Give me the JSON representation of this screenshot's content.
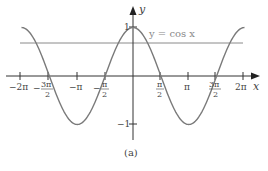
{
  "chart_data": {
    "type": "line",
    "title": "",
    "caption": "(a)",
    "xlabel": "x",
    "ylabel": "y",
    "series": [
      {
        "name": "y = cos x",
        "function": "cos(x)",
        "x_range": [
          "-2π",
          "2π"
        ]
      },
      {
        "name": "horizontal line",
        "function": "constant",
        "approx_value": 0.66
      }
    ],
    "annotation": "y = cos x",
    "xlim": [
      "-2π",
      "2π"
    ],
    "ylim": [
      -1,
      1
    ],
    "x_ticks": [
      {
        "label": "−2π",
        "value": -6.2832
      },
      {
        "label": "3π/2",
        "num": "3π",
        "den": "2",
        "neg": true,
        "value": -4.7124
      },
      {
        "label": "−π",
        "value": -3.1416
      },
      {
        "label": "π/2",
        "num": "π",
        "den": "2",
        "neg": true,
        "value": -1.5708
      },
      {
        "label": "π/2",
        "num": "π",
        "den": "2",
        "neg": false,
        "value": 1.5708
      },
      {
        "label": "π",
        "value": 3.1416
      },
      {
        "label": "3π/2",
        "num": "3π",
        "den": "2",
        "neg": false,
        "value": 4.7124
      },
      {
        "label": "2π",
        "value": 6.2832
      }
    ],
    "y_ticks": [
      {
        "label": "1",
        "value": 1
      },
      {
        "label": "−1",
        "value": -1
      }
    ],
    "grid": false,
    "legend": "none"
  },
  "labels": {
    "x_axis": "x",
    "y_axis": "y",
    "equation": "y = cos x",
    "y_one": "1",
    "y_neg_one": "−1",
    "neg_two_pi": "−2π",
    "neg_three_pi_num": "3π",
    "neg_three_pi_den": "2",
    "neg_pi": "−π",
    "neg_half_pi_num": "π",
    "neg_half_pi_den": "2",
    "half_pi_num": "π",
    "half_pi_den": "2",
    "pi": "π",
    "three_pi_num": "3π",
    "three_pi_den": "2",
    "two_pi": "2π",
    "caption": "(a)"
  },
  "colors": {
    "curve": "#7a7a7a",
    "axes": "#333333",
    "hline": "#8a8a8a",
    "text": "#444444"
  }
}
